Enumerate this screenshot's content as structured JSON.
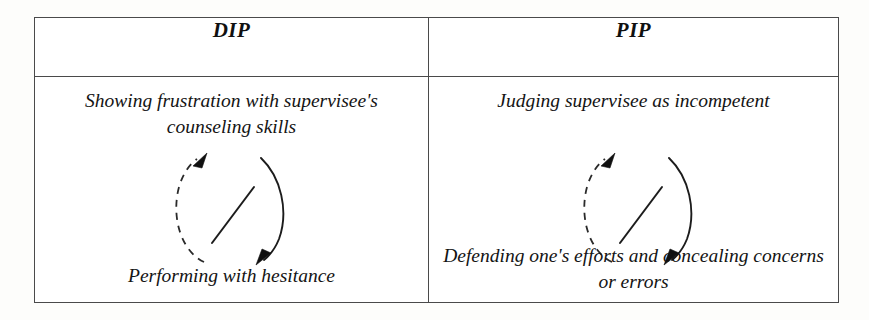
{
  "figure": {
    "type": "comparison-table",
    "background_color": "#fdfdfb",
    "border_color": "#4a4a4a",
    "ink_color": "#101010",
    "columns": [
      {
        "key": "dip",
        "header": "DIP",
        "top_label": "Showing frustration with supervisee's counseling skills",
        "bottom_label": "Performing with hesitance",
        "diagram": {
          "name": "interpersonal-cycle-loop",
          "dashed_arrow": {
            "direction": "upward",
            "from": "bottom_label",
            "to": "top_label",
            "style": "dashed",
            "arrowhead": "top"
          },
          "solid_arrow": {
            "direction": "downward",
            "from": "top_label",
            "to": "bottom_label",
            "style": "solid",
            "arrowhead": "bottom"
          },
          "diagonal_line": {
            "style": "solid",
            "orientation": "bottom-left-to-top-right"
          }
        }
      },
      {
        "key": "pip",
        "header": "PIP",
        "top_label": "Judging supervisee as incompetent",
        "bottom_label": "Defending one's efforts and concealing concerns or errors",
        "diagram": {
          "name": "interpersonal-cycle-loop",
          "dashed_arrow": {
            "direction": "upward",
            "from": "bottom_label",
            "to": "top_label",
            "style": "dashed",
            "arrowhead": "top"
          },
          "solid_arrow": {
            "direction": "downward",
            "from": "top_label",
            "to": "bottom_label",
            "style": "solid",
            "arrowhead": "bottom"
          },
          "diagonal_line": {
            "style": "solid",
            "orientation": "bottom-left-to-top-right"
          }
        }
      }
    ]
  }
}
